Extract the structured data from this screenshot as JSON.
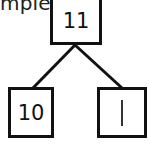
{
  "caption": "mple.",
  "number_bond": {
    "whole": "11",
    "parts": [
      {
        "value": "10"
      },
      {
        "value": "|"
      }
    ]
  }
}
